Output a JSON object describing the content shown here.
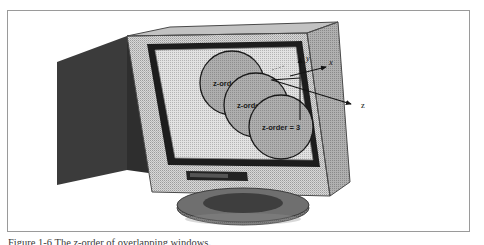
{
  "figure": {
    "caption": "Figure 1-6  The z-order of overlapping windows.",
    "border_color": "#9a9a9a",
    "background": "#ffffff"
  },
  "device": {
    "name": "crt-monitor",
    "case_front_color": "#c9c9c9",
    "case_back_color": "#3b3b3b",
    "case_side_color": "#6e6e6e",
    "inner_bezel_color": "#1d1d1d",
    "screen_color": "#d2d2d2",
    "stand_color": "#6b6b6b",
    "base_color": "#5e5e5e",
    "control_strip_color": "#232323"
  },
  "screen": {
    "name": "monitor-screen",
    "circles": [
      {
        "label": "z-order = 1",
        "z": 1,
        "cx": 232,
        "cy": 83,
        "r": 32,
        "fill": "#a8a8a8",
        "stroke": "#1a1a1a"
      },
      {
        "label": "z-order = 2",
        "z": 2,
        "cx": 256,
        "cy": 105,
        "r": 32,
        "fill": "#a8a8a8",
        "stroke": "#1a1a1a"
      },
      {
        "label": "z-order = 3",
        "z": 3,
        "cx": 281,
        "cy": 127,
        "r": 32,
        "fill": "#a8a8a8",
        "stroke": "#1a1a1a"
      }
    ]
  },
  "axes": {
    "name": "3d-coordinate-axes",
    "origin": {
      "x": 300,
      "y": 78
    },
    "items": [
      {
        "axis": "y",
        "label": "y",
        "direction": "up",
        "tip_x": 300,
        "tip_y": 57,
        "label_x": 305,
        "label_y": 58
      },
      {
        "axis": "x",
        "label": "x",
        "direction": "up-right",
        "tip_x": 327,
        "tip_y": 67,
        "label_x": 330,
        "label_y": 65
      },
      {
        "axis": "z",
        "label": "z",
        "direction": "down-right",
        "tip_x": 352,
        "tip_y": 104,
        "label_x": 360,
        "label_y": 107
      }
    ],
    "stroke": "#141414",
    "label_color": "#141414"
  }
}
